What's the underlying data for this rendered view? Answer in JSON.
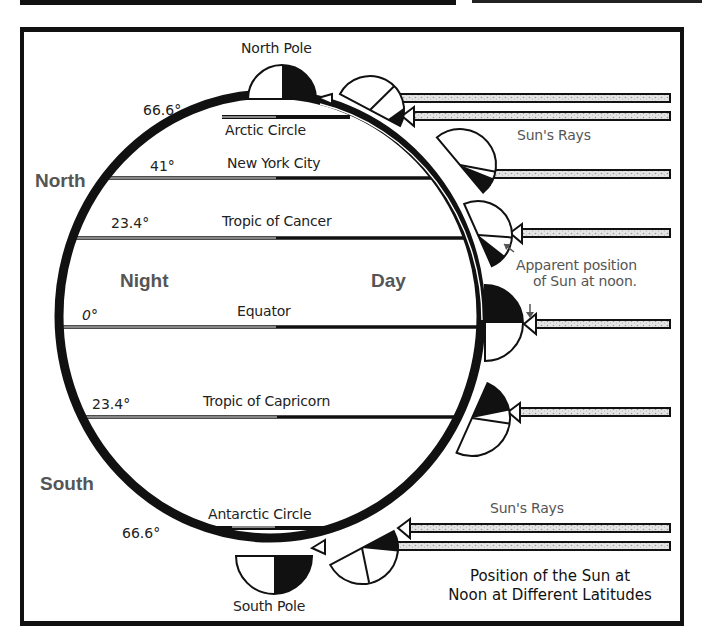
{
  "title": {
    "line1": "Position of the Sun at",
    "line2": "Noon at Different Latitudes"
  },
  "hemispheres": {
    "north": "North",
    "south": "South"
  },
  "sides": {
    "night": "Night",
    "day": "Day"
  },
  "poles": {
    "north": "North Pole",
    "south": "South Pole"
  },
  "latitudes": [
    {
      "degree": "66.6°",
      "name": "Arctic Circle"
    },
    {
      "degree": "41°",
      "name": "New York City"
    },
    {
      "degree": "23.4°",
      "name": "Tropic of Cancer"
    },
    {
      "degree": "0°",
      "name": "Equator"
    },
    {
      "degree": "23.4°",
      "name": "Tropic of Capricorn"
    },
    {
      "degree": "66.6°",
      "name": "Antarctic Circle"
    }
  ],
  "annotations": {
    "suns_rays_top": "Sun's Rays",
    "suns_rays_bottom": "Sun's Rays",
    "apparent_position_line1": "Apparent position",
    "apparent_position_line2": "of Sun at noon."
  },
  "colors": {
    "ink": "#111111",
    "label_gray": "#555555",
    "ray_fill": "#d8d8d8",
    "background": "#ffffff"
  }
}
